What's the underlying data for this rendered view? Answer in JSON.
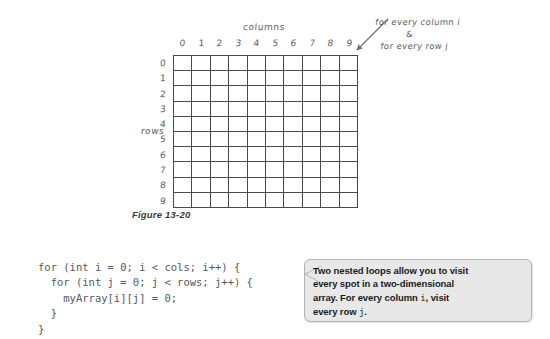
{
  "figure": {
    "caption": "Figure 13-20",
    "columns_label": "columns",
    "rows_label": "rows",
    "column_numbers": [
      "0",
      "1",
      "2",
      "3",
      "4",
      "5",
      "6",
      "7",
      "8",
      "9"
    ],
    "row_numbers": [
      "0",
      "1",
      "2",
      "3",
      "4",
      "5",
      "6",
      "7",
      "8",
      "9"
    ],
    "grid_rows": 10,
    "grid_cols": 10,
    "grid_line_color": "#4a4a4a",
    "annotation": {
      "line1": "for every column i",
      "line2": "&",
      "line3": "for every row j"
    }
  },
  "code": {
    "text": "for (int i = 0; i < cols; i++) {\n  for (int j = 0; j < rows; j++) {\n    myArray[i][j] = 0;\n  }\n}"
  },
  "callout": {
    "line1": "Two nested loops allow you to visit",
    "line2": "every spot in a two-dimensional",
    "line3_a": "array. For every column ",
    "line3_i": "i",
    "line3_b": ", visit",
    "line4_a": "every row ",
    "line4_j": "j",
    "line4_b": ".",
    "background_color": "#e8e8e8",
    "border_color": "#b4b4b4"
  }
}
